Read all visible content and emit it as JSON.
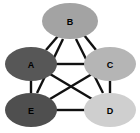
{
  "graph": {
    "title": "Node graph with five labeled elliptical nodes",
    "background_color": "#ffffff",
    "edge_color": "#111111",
    "edge_width": 2.4,
    "label_color": "#000000",
    "nodes": [
      {
        "id": "A",
        "label": "A",
        "cx": 31,
        "cy": 64,
        "rx": 26,
        "ry": 17,
        "fill": "#575757"
      },
      {
        "id": "B",
        "label": "B",
        "cx": 70,
        "cy": 21,
        "rx": 28,
        "ry": 18,
        "fill": "#a3a3a3"
      },
      {
        "id": "C",
        "label": "C",
        "cx": 110,
        "cy": 64,
        "rx": 26,
        "ry": 17,
        "fill": "#b5b5b5"
      },
      {
        "id": "D",
        "label": "D",
        "cx": 110,
        "cy": 110,
        "rx": 26,
        "ry": 17,
        "fill": "#cfcfcf"
      },
      {
        "id": "E",
        "label": "E",
        "cx": 31,
        "cy": 110,
        "rx": 26,
        "ry": 17,
        "fill": "#4f4f4f"
      }
    ],
    "edges": [
      {
        "id": "A-B",
        "from": "A",
        "to": "B",
        "x1": 46,
        "y1": 50,
        "x2": 58,
        "y2": 36
      },
      {
        "id": "B-C",
        "from": "B",
        "to": "C",
        "x1": 84,
        "y1": 35,
        "x2": 96,
        "y2": 50
      },
      {
        "id": "B-E",
        "from": "B",
        "to": "E",
        "x1": 63,
        "y1": 39,
        "x2": 37,
        "y2": 93
      },
      {
        "id": "B-D",
        "from": "B",
        "to": "D",
        "x1": 76,
        "y1": 39,
        "x2": 103,
        "y2": 93
      },
      {
        "id": "A-C",
        "from": "A",
        "to": "C",
        "x1": 54,
        "y1": 64,
        "x2": 86,
        "y2": 64
      },
      {
        "id": "A-E",
        "from": "A",
        "to": "E",
        "x1": 31,
        "y1": 81,
        "x2": 31,
        "y2": 93
      },
      {
        "id": "C-D",
        "from": "C",
        "to": "D",
        "x1": 110,
        "y1": 81,
        "x2": 110,
        "y2": 93
      },
      {
        "id": "E-D",
        "from": "E",
        "to": "D",
        "x1": 56,
        "y1": 110,
        "x2": 86,
        "y2": 110
      },
      {
        "id": "A-D",
        "from": "A",
        "to": "D",
        "x1": 50,
        "y1": 74,
        "x2": 92,
        "y2": 99
      },
      {
        "id": "E-C",
        "from": "E",
        "to": "C",
        "x1": 50,
        "y1": 99,
        "x2": 92,
        "y2": 74
      }
    ]
  }
}
